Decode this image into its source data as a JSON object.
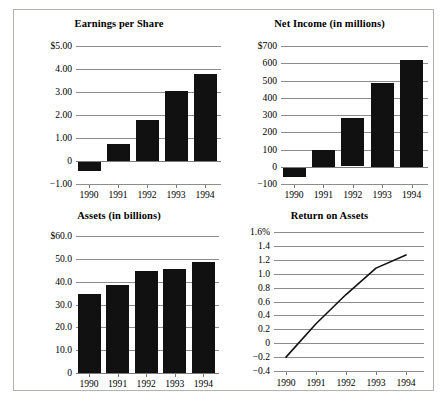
{
  "document": {
    "kind": "financial-highlights-chart-sheet",
    "panel_count": 4
  },
  "panels": {
    "eps": {
      "title": "Earnings per Share"
    },
    "net_income": {
      "title": "Net Income (in millions)"
    },
    "assets": {
      "title": "Assets (in billions)"
    },
    "roa": {
      "title": "Return on Assets"
    }
  },
  "chart_data": [
    {
      "id": "eps",
      "type": "bar",
      "title": "Earnings per Share",
      "xlabel": "",
      "ylabel": "",
      "categories": [
        "1990",
        "1991",
        "1992",
        "1993",
        "1994"
      ],
      "values": [
        -0.45,
        0.75,
        1.78,
        3.03,
        3.8
      ],
      "ylim": [
        -1.0,
        5.0
      ],
      "yticks": [
        5.0,
        4.0,
        3.0,
        2.0,
        1.0,
        0,
        -1.0
      ],
      "ytick_labels": [
        "$5.00",
        "4.00",
        "3.00",
        "2.00",
        "1.00",
        "0",
        "−1.00"
      ],
      "grid": true,
      "legend": "none",
      "bar_color": "#111111"
    },
    {
      "id": "net_income",
      "type": "bar",
      "title": "Net Income (in millions)",
      "xlabel": "",
      "ylabel": "",
      "categories": [
        "1990",
        "1991",
        "1992",
        "1993",
        "1994"
      ],
      "values": [
        -60,
        97,
        280,
        485,
        620
      ],
      "ylim": [
        -100,
        700
      ],
      "yticks": [
        700,
        600,
        500,
        400,
        300,
        200,
        100,
        0,
        -100
      ],
      "ytick_labels": [
        "$700",
        "600",
        "500",
        "400",
        "300",
        "200",
        "100",
        "0",
        "−100"
      ],
      "grid": true,
      "legend": "none",
      "bar_color": "#111111"
    },
    {
      "id": "assets",
      "type": "bar",
      "title": "Assets (in billions)",
      "xlabel": "",
      "ylabel": "",
      "categories": [
        "1990",
        "1991",
        "1992",
        "1993",
        "1994"
      ],
      "values": [
        34.7,
        38.7,
        44.8,
        45.6,
        48.6
      ],
      "ylim": [
        0,
        60
      ],
      "yticks": [
        60,
        50,
        40,
        30,
        20,
        10,
        0
      ],
      "ytick_labels": [
        "$60.0",
        "50.0",
        "40.0",
        "30.0",
        "20.0",
        "10.0",
        "0"
      ],
      "grid": true,
      "legend": "none",
      "bar_color": "#111111"
    },
    {
      "id": "roa",
      "type": "line",
      "title": "Return on Assets",
      "xlabel": "",
      "ylabel": "",
      "categories": [
        "1990",
        "1991",
        "1992",
        "1993",
        "1994"
      ],
      "values": [
        -0.2,
        0.28,
        0.7,
        1.08,
        1.27
      ],
      "ylim": [
        -0.4,
        1.6
      ],
      "yticks": [
        1.6,
        1.4,
        1.2,
        1.0,
        0.8,
        0.6,
        0.4,
        0.2,
        0,
        -0.2,
        -0.4
      ],
      "ytick_labels": [
        "1.6%",
        "1.4",
        "1.2",
        "1.0",
        "0.8",
        "0.6",
        "0.4",
        "0.2",
        "0",
        "−0.2",
        "−0.4"
      ],
      "grid": true,
      "legend": "none",
      "line_color": "#111111"
    }
  ]
}
